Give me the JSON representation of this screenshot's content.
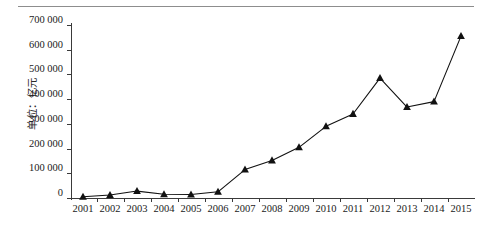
{
  "figure": {
    "y_axis_caption": "单位：亿元",
    "has_top_rule": true,
    "line_color": "#111111",
    "marker_color": "#111111",
    "axis_color": "#3a3a3a",
    "background": "#ffffff"
  },
  "chart_data": {
    "type": "line",
    "title": "",
    "subtitle": "",
    "xlabel": "",
    "ylabel": "单位：亿元",
    "categories": [
      "2001",
      "2002",
      "2003",
      "2004",
      "2005",
      "2006",
      "2007",
      "2008",
      "2009",
      "2010",
      "2011",
      "2012",
      "2013",
      "2014",
      "2015"
    ],
    "values": [
      5000,
      12000,
      28000,
      15000,
      14000,
      25000,
      115000,
      152000,
      205000,
      290000,
      340000,
      485000,
      368000,
      390000,
      655000
    ],
    "series": [
      {
        "name": "",
        "marker": "triangle",
        "values": [
          5000,
          12000,
          28000,
          15000,
          14000,
          25000,
          115000,
          152000,
          205000,
          290000,
          340000,
          485000,
          368000,
          390000,
          655000
        ]
      }
    ],
    "ylim": [
      0,
      700000
    ],
    "ytick_values": [
      0,
      100000,
      200000,
      300000,
      400000,
      500000,
      600000,
      700000
    ],
    "ytick_labels": [
      "0",
      "100 000",
      "200 000",
      "300 000",
      "400 000",
      "500 000",
      "600 000",
      "700 000"
    ],
    "xtick_labels": [
      "2001",
      "2002",
      "2003",
      "2004",
      "2005",
      "2006",
      "2007",
      "2008",
      "2009",
      "2010",
      "2011",
      "2012",
      "2013",
      "2014",
      "2015"
    ],
    "grid": false,
    "legend": "none"
  }
}
